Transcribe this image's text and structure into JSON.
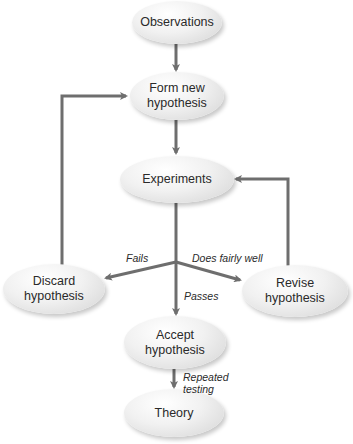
{
  "diagram": {
    "title": "",
    "edge_color": "#6e6e6e",
    "nodes": {
      "observations": "Observations",
      "form_new_l1": "Form new",
      "form_new_l2": "hypothesis",
      "experiments": "Experiments",
      "discard_l1": "Discard",
      "discard_l2": "hypothesis",
      "revise_l1": "Revise",
      "revise_l2": "hypothesis",
      "accept_l1": "Accept",
      "accept_l2": "hypothesis",
      "theory": "Theory"
    },
    "edge_labels": {
      "fails": "Fails",
      "does_fairly_well": "Does fairly well",
      "passes": "Passes",
      "repeated_l1": "Repeated",
      "repeated_l2": "testing"
    },
    "edges": [
      {
        "from": "Observations",
        "to": "Form new hypothesis"
      },
      {
        "from": "Form new hypothesis",
        "to": "Experiments"
      },
      {
        "from": "Experiments",
        "to": "Discard hypothesis",
        "label": "Fails"
      },
      {
        "from": "Experiments",
        "to": "Revise hypothesis",
        "label": "Does fairly well"
      },
      {
        "from": "Experiments",
        "to": "Accept hypothesis",
        "label": "Passes"
      },
      {
        "from": "Discard hypothesis",
        "to": "Form new hypothesis"
      },
      {
        "from": "Revise hypothesis",
        "to": "Experiments"
      },
      {
        "from": "Accept hypothesis",
        "to": "Theory",
        "label": "Repeated testing"
      }
    ]
  }
}
